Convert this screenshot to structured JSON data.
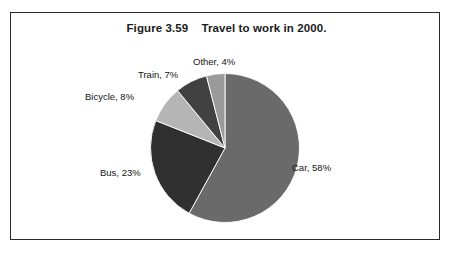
{
  "figure": {
    "title": "Figure 3.59    Travel to work in 2000.",
    "frame_color": "#2b2b2b",
    "background": "#ffffff"
  },
  "chart_data": {
    "type": "pie",
    "title": "Figure 3.59    Travel to work in 2000.",
    "xlabel": "",
    "ylabel": "",
    "start_angle_deg": 0,
    "direction": "clockwise",
    "legend": "none",
    "grid": false,
    "categories": [
      "Car",
      "Bus",
      "Bicycle",
      "Train",
      "Other"
    ],
    "values": [
      58,
      23,
      8,
      7,
      4
    ],
    "unit": "%",
    "total": 100,
    "slices": [
      {
        "name": "Car",
        "value": 58,
        "label": "Car, 58%",
        "color": "#6a6a6a"
      },
      {
        "name": "Bus",
        "value": 23,
        "label": "Bus, 23%",
        "color": "#303030"
      },
      {
        "name": "Bicycle",
        "value": 8,
        "label": "Bicycle, 8%",
        "color": "#b5b5b5"
      },
      {
        "name": "Train",
        "value": 7,
        "label": "Train, 7%",
        "color": "#414141"
      },
      {
        "name": "Other",
        "value": 4,
        "label": "Other, 4%",
        "color": "#9a9a9a"
      }
    ]
  }
}
